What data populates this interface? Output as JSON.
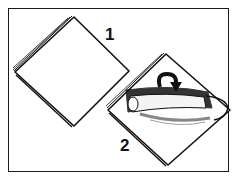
{
  "figure": {
    "type": "instructional-illustration",
    "steps": [
      {
        "number": "1",
        "description": "Flat square napkin, layered edges, placed as a diamond"
      },
      {
        "number": "2",
        "description": "Napkin as a diamond with the top portion rolled into a tube; curved arrow indicates rolling/folding downward"
      }
    ],
    "colors": {
      "line": "#111111",
      "background": "#ffffff",
      "frame": "#1a1a1a"
    }
  }
}
